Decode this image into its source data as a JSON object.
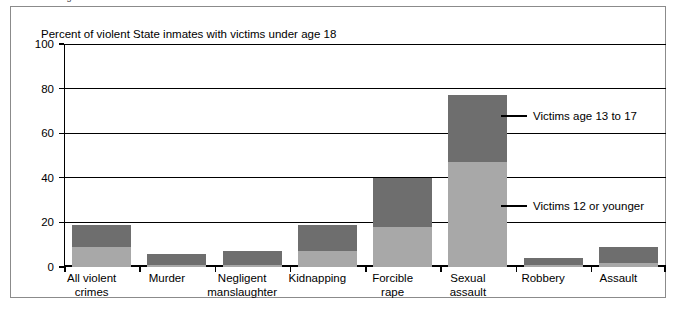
{
  "cut_headline": "among inmates convicted of sexual assault had abused a child",
  "figure": {
    "axis_title": "Percent of violent State inmates with victims under age 18"
  },
  "legend": [
    {
      "name": "victims-13-to-17",
      "label": "Victims age 13 to 17",
      "color": "#6e6e6e",
      "y": 109
    },
    {
      "name": "victims-12-or-younger",
      "label": "Victims 12 or younger",
      "color": "#a8a8a8",
      "y": 199
    }
  ],
  "chart_data": {
    "type": "bar",
    "stacked": true,
    "title": "Percent of violent State inmates with victims under age 18",
    "xlabel": "",
    "ylabel": "Percent of violent State inmates with victims under age 18",
    "ylim": [
      0,
      100
    ],
    "yticks": [
      0,
      20,
      40,
      60,
      80,
      100
    ],
    "grid": true,
    "legend_position": "inside-right",
    "categories": [
      "All violent\ncrimes",
      "Murder",
      "Negligent\nmanslaughter",
      "Kidnapping",
      "Forcible\nrape",
      "Sexual\nassault",
      "Robbery",
      "Assault"
    ],
    "series": [
      {
        "name": "Victims 12 or younger",
        "color": "#a8a8a8",
        "values": [
          9,
          1,
          1,
          7,
          18,
          47,
          1,
          2
        ]
      },
      {
        "name": "Victims age 13 to 17",
        "color": "#6e6e6e",
        "values": [
          10,
          5,
          6,
          12,
          22,
          30,
          3,
          7
        ]
      }
    ],
    "totals": [
      19,
      6,
      7,
      19,
      40,
      77,
      4,
      9
    ]
  }
}
